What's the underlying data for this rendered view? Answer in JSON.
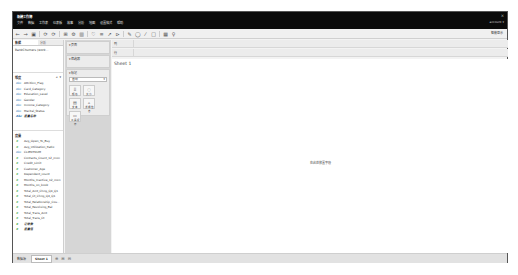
{
  "window": {
    "title": "新建工作簿",
    "close_label": "×",
    "account_label": "account ▾"
  },
  "menu": [
    "文件",
    "数据",
    "工作表",
    "仪表板",
    "故事",
    "分析",
    "地图",
    "设置格式",
    "帮助"
  ],
  "toolbar": {
    "icons": [
      "←",
      "→",
      "▣",
      "⟳",
      "⟳",
      "⊞",
      "⚙",
      "▥",
      "♡",
      "≡",
      "↗",
      "⊳",
      "✎",
      "◯",
      "⁄",
      "□",
      "▦",
      "♀"
    ],
    "show_me_label": "智能显示"
  },
  "data_pane": {
    "tabs": [
      "数据",
      "分析"
    ],
    "datasource": "BankChurners (work...",
    "dimensions_title": "维度",
    "dimensions": [
      {
        "type": "Abc",
        "name": "Attrition_Flag"
      },
      {
        "type": "Abc",
        "name": "Card_Category"
      },
      {
        "type": "Abc",
        "name": "Education_Level"
      },
      {
        "type": "Abc",
        "name": "Gender"
      },
      {
        "type": "Abc",
        "name": "Income_Category"
      },
      {
        "type": "Abc",
        "name": "Marital_Status"
      },
      {
        "type": "Abc",
        "name": "度量名称"
      }
    ],
    "measures_title": "度量",
    "measures": [
      {
        "type": "#",
        "name": "Avg_Open_To_Buy"
      },
      {
        "type": "#",
        "name": "Avg_Utilization_Ratio"
      },
      {
        "type": "Abc",
        "name": "CLIENTNUM"
      },
      {
        "type": "#",
        "name": "Contacts_Count_12_mon"
      },
      {
        "type": "#",
        "name": "Credit_Limit"
      },
      {
        "type": "#",
        "name": "Customer_Age"
      },
      {
        "type": "#",
        "name": "Dependent_count"
      },
      {
        "type": "#",
        "name": "Months_Inactive_12_mon"
      },
      {
        "type": "#",
        "name": "Months_on_book"
      },
      {
        "type": "#",
        "name": "Total_Amt_Chng_Q4_Q1"
      },
      {
        "type": "#",
        "name": "Total_Ct_Chng_Q4_Q1"
      },
      {
        "type": "#",
        "name": "Total_Relationship_Cou..."
      },
      {
        "type": "#",
        "name": "Total_Revolving_Bal"
      },
      {
        "type": "#",
        "name": "Total_Trans_Amt"
      },
      {
        "type": "#",
        "name": "Total_Trans_Ct"
      },
      {
        "type": "#",
        "name": "记录数"
      },
      {
        "type": "#",
        "name": "度量值"
      }
    ]
  },
  "cards": {
    "pages_label": "▾ 页面",
    "filters_label": "▾ 筛选器",
    "marks_label": "▾ 标记",
    "marks_type": "自动",
    "mark_buttons": [
      {
        "icon": "⠿",
        "label": "颜色"
      },
      {
        "icon": "◌",
        "label": "大小"
      },
      {
        "icon": "▤",
        "label": "文本"
      },
      {
        "icon": "▵",
        "label": "详细信息"
      },
      {
        "icon": "▭",
        "label": "工具提示"
      }
    ]
  },
  "shelves": {
    "columns_label": "列",
    "rows_label": "行"
  },
  "view": {
    "sheet_title": "Sheet 1",
    "placeholder": "在此处放置字段"
  },
  "bottom": {
    "datasource_tab": "数据源",
    "sheet_tab": "Sheet 1",
    "icons": [
      "⊕",
      "⊞",
      "⊟"
    ]
  }
}
